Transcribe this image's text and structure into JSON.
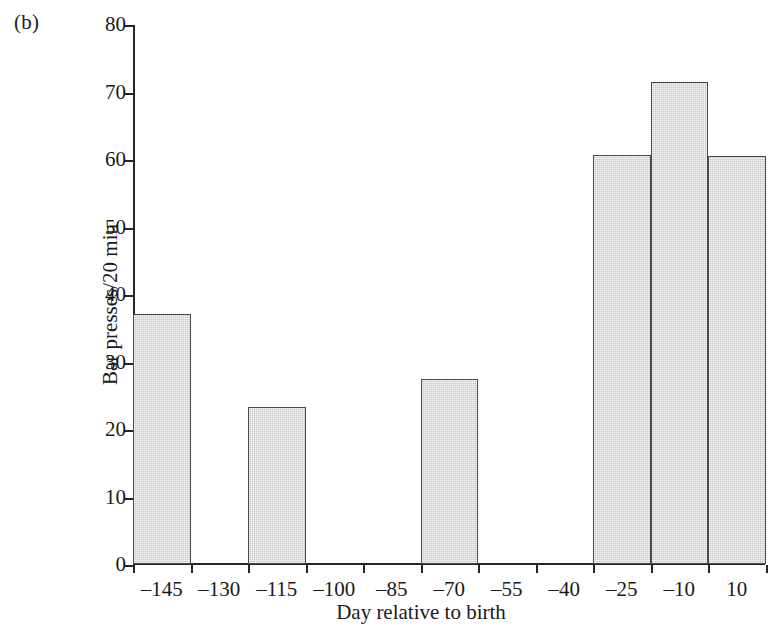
{
  "figure": {
    "panel_label": "(b)"
  },
  "chart_data": {
    "type": "bar",
    "title": "",
    "xlabel": "Day relative to birth",
    "ylabel": "Bar presses/20 min",
    "categories": [
      "-145",
      "-130",
      "-115",
      "-100",
      "-85",
      "-70",
      "-55",
      "-40",
      "-25",
      "-10",
      "10"
    ],
    "tick_labels": [
      "–145",
      "–130",
      "–115",
      "–100",
      "–85",
      "–70",
      "–55",
      "–40",
      "–25",
      "–10",
      "10"
    ],
    "values": [
      37.0,
      0,
      23.2,
      0,
      0,
      27.4,
      0,
      0,
      60.6,
      71.4,
      60.4
    ],
    "ylim": [
      0,
      80
    ],
    "ytick_labels": [
      "80",
      "70",
      "60",
      "50",
      "40",
      "30",
      "20",
      "10",
      "0"
    ],
    "ytick_values": [
      80,
      70,
      60,
      50,
      40,
      30,
      20,
      10,
      0
    ],
    "grid": false,
    "legend": "none",
    "bar_fill_color": "#c9c9c9",
    "bar_edge_color": "#4a4a4a",
    "axis_color": "#262626"
  }
}
